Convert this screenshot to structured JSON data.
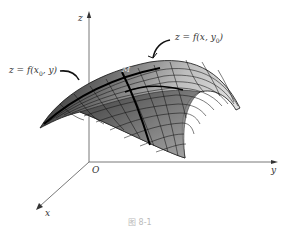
{
  "diagram": {
    "type": "3d-surface",
    "axes": {
      "x": {
        "label": "x"
      },
      "y": {
        "label": "y"
      },
      "z": {
        "label": "z"
      },
      "origin": {
        "label": "O"
      }
    },
    "annotations": [
      {
        "id": "curve-x0",
        "text": "z = f(x",
        "sub": "0",
        "tail": ", y)"
      },
      {
        "id": "curve-y0",
        "text": "z = f(x, y",
        "sub": "0",
        "tail": ")"
      },
      {
        "id": "point",
        "text": "M"
      }
    ],
    "caption": "图 8-1"
  },
  "colors": {
    "axis": "#555555",
    "surface_dark": "#2a2a2a",
    "surface_light": "#c8c8c8",
    "grid": "#111111"
  }
}
